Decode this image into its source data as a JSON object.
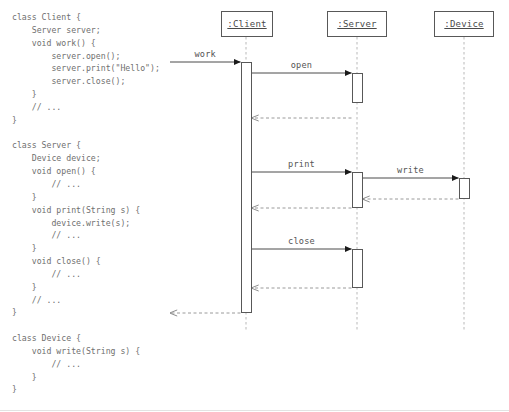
{
  "code": {
    "lines": [
      "class Client {",
      "    Server server;",
      "    void work() {",
      "        server.open();",
      "        server.print(\"Hello\");",
      "        server.close();",
      "    }",
      "    // ...",
      "}",
      "",
      "class Server {",
      "    Device device;",
      "    void open() {",
      "        // ...",
      "    }",
      "    void print(String s) {",
      "        device.write(s);",
      "        // ...",
      "    }",
      "    void close() {",
      "        // ...",
      "    }",
      "    // ...",
      "}",
      "",
      "class Device {",
      "    void write(String s) {",
      "        // ...",
      "    }",
      "}"
    ]
  },
  "diagram": {
    "type": "uml-sequence-diagram",
    "lifelines": [
      {
        "label": ":Client",
        "x": 246,
        "box_left": 221,
        "box_top": 11,
        "box_width": 52,
        "box_height": 26
      },
      {
        "label": ":Server",
        "x": 357,
        "box_left": 327,
        "box_top": 11,
        "box_width": 60,
        "box_height": 26
      },
      {
        "label": ":Device",
        "x": 464,
        "box_left": 434,
        "box_top": 11,
        "box_width": 60,
        "box_height": 26
      }
    ],
    "messages": [
      {
        "label": "work",
        "from": "found",
        "to": ":Client",
        "kind": "call",
        "y": 62
      },
      {
        "label": "open",
        "from": ":Client",
        "to": ":Server",
        "kind": "call",
        "y": 73
      },
      {
        "label": "",
        "from": ":Server",
        "to": ":Client",
        "kind": "return",
        "y": 118
      },
      {
        "label": "print",
        "from": ":Client",
        "to": ":Server",
        "kind": "call",
        "y": 172
      },
      {
        "label": "write",
        "from": ":Server",
        "to": ":Device",
        "kind": "call",
        "y": 178
      },
      {
        "label": "",
        "from": ":Device",
        "to": ":Server",
        "kind": "return",
        "y": 199
      },
      {
        "label": "",
        "from": ":Server",
        "to": ":Client",
        "kind": "return",
        "y": 208
      },
      {
        "label": "close",
        "from": ":Client",
        "to": ":Server",
        "kind": "call",
        "y": 249
      },
      {
        "label": "",
        "from": ":Server",
        "to": ":Client",
        "kind": "return",
        "y": 288
      },
      {
        "label": "",
        "from": ":Client",
        "to": "found",
        "kind": "return",
        "y": 313
      }
    ],
    "activations": [
      {
        "actor": ":Client",
        "top": 62,
        "bottom": 313
      },
      {
        "actor": ":Server",
        "top": 73,
        "bottom": 103
      },
      {
        "actor": ":Server",
        "top": 172,
        "bottom": 208
      },
      {
        "actor": ":Server",
        "top": 249,
        "bottom": 288
      },
      {
        "actor": ":Device",
        "top": 178,
        "bottom": 199
      }
    ]
  },
  "colors": {
    "code_text": "#6f6f6f",
    "line": "#585858",
    "lifeline_dash": "#b9b9b9",
    "label_text": "#555555",
    "background": "#ffffff"
  }
}
